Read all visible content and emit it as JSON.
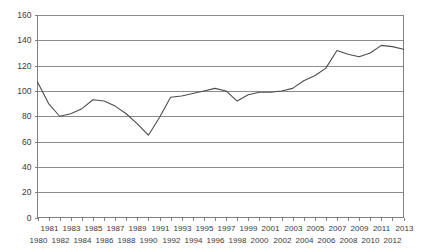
{
  "chart_data": {
    "type": "line",
    "title": "",
    "xlabel": "",
    "ylabel": "",
    "ylim": [
      0,
      160
    ],
    "ytick_step": 20,
    "yticks": [
      0,
      20,
      40,
      60,
      80,
      100,
      120,
      140,
      160
    ],
    "grid": true,
    "legend": false,
    "legend_position": "none",
    "xlim": [
      1980,
      2013
    ],
    "x": [
      1980,
      1981,
      1982,
      1983,
      1984,
      1985,
      1986,
      1987,
      1988,
      1989,
      1990,
      1991,
      1992,
      1993,
      1994,
      1995,
      1996,
      1997,
      1998,
      1999,
      2000,
      2001,
      2002,
      2003,
      2004,
      2005,
      2006,
      2007,
      2008,
      2009,
      2010,
      2011,
      2012,
      2013
    ],
    "xtick_labels": [
      "1980",
      "1981",
      "1982",
      "1983",
      "1984",
      "1985",
      "1986",
      "1987",
      "1988",
      "1989",
      "1990",
      "1991",
      "1992",
      "1993",
      "1994",
      "1995",
      "1996",
      "1997",
      "1998",
      "1999",
      "2000",
      "2001",
      "2002",
      "2003",
      "2004",
      "2005",
      "2006",
      "2007",
      "2008",
      "2009",
      "2010",
      "2011",
      "2012",
      "2013"
    ],
    "series": [
      {
        "name": "series-1",
        "color": "#4d4d4d",
        "values": [
          107,
          90,
          80,
          82,
          86,
          93,
          92,
          88,
          82,
          74,
          65,
          79,
          95,
          96,
          98,
          100,
          102,
          100,
          92,
          97,
          99,
          99,
          100,
          102,
          108,
          112,
          118,
          132,
          129,
          127,
          130,
          136,
          135,
          133
        ]
      }
    ]
  },
  "axes": {
    "y_axis_name": "y-axis",
    "x_axis_name": "x-axis"
  }
}
